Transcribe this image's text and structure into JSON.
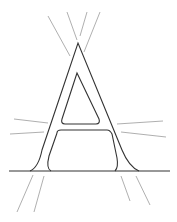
{
  "illustration": {
    "subject": "Outlined letter A with radiating guide lines",
    "letter": "A",
    "colors": {
      "background": "#ffffff",
      "outline": "#333333",
      "guide_lines": "#9a9a9a"
    }
  }
}
